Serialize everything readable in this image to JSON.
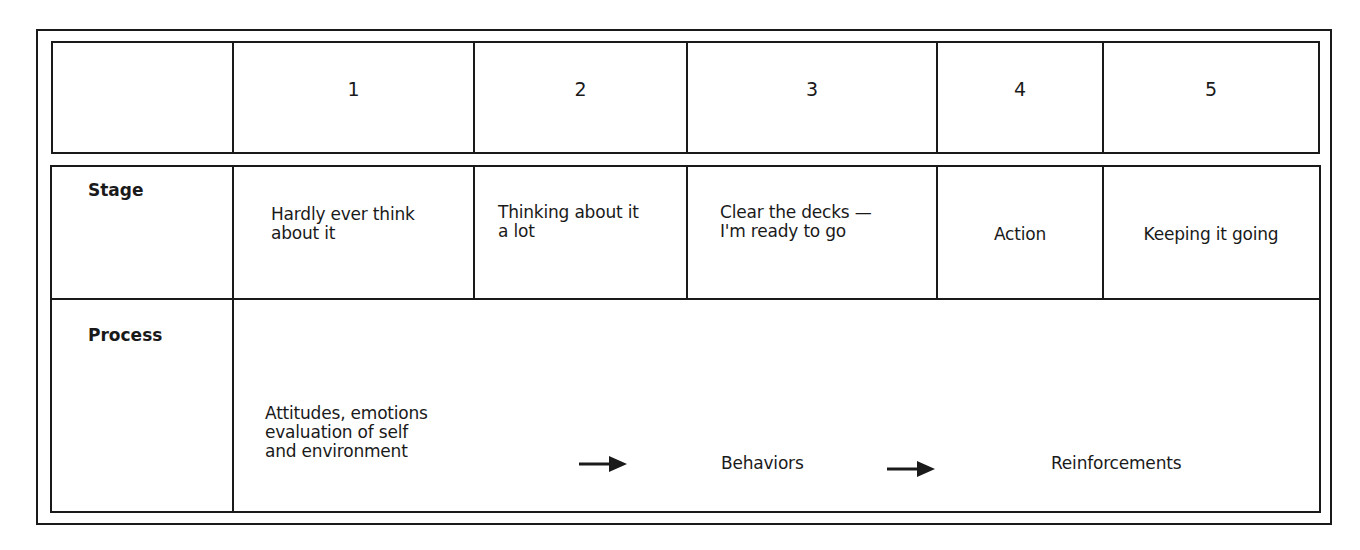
{
  "header_row": {
    "corner": "",
    "columns": [
      "1",
      "2",
      "3",
      "4",
      "5"
    ]
  },
  "stage_row": {
    "label": "Stage",
    "cells": [
      "Hardly ever think\nabout it",
      "Thinking about it\na lot",
      "Clear the decks —\nI'm ready to go",
      "Action",
      "Keeping it going"
    ]
  },
  "process_row": {
    "label": "Process",
    "steps": [
      "Attitudes, emotions\nevaluation of self\nand environment",
      "Behaviors",
      "Reinforcements"
    ],
    "arrows": [
      "arrow-right",
      "arrow-right"
    ]
  },
  "colors": {
    "line": "#1a1a1a",
    "background": "#ffffff"
  }
}
